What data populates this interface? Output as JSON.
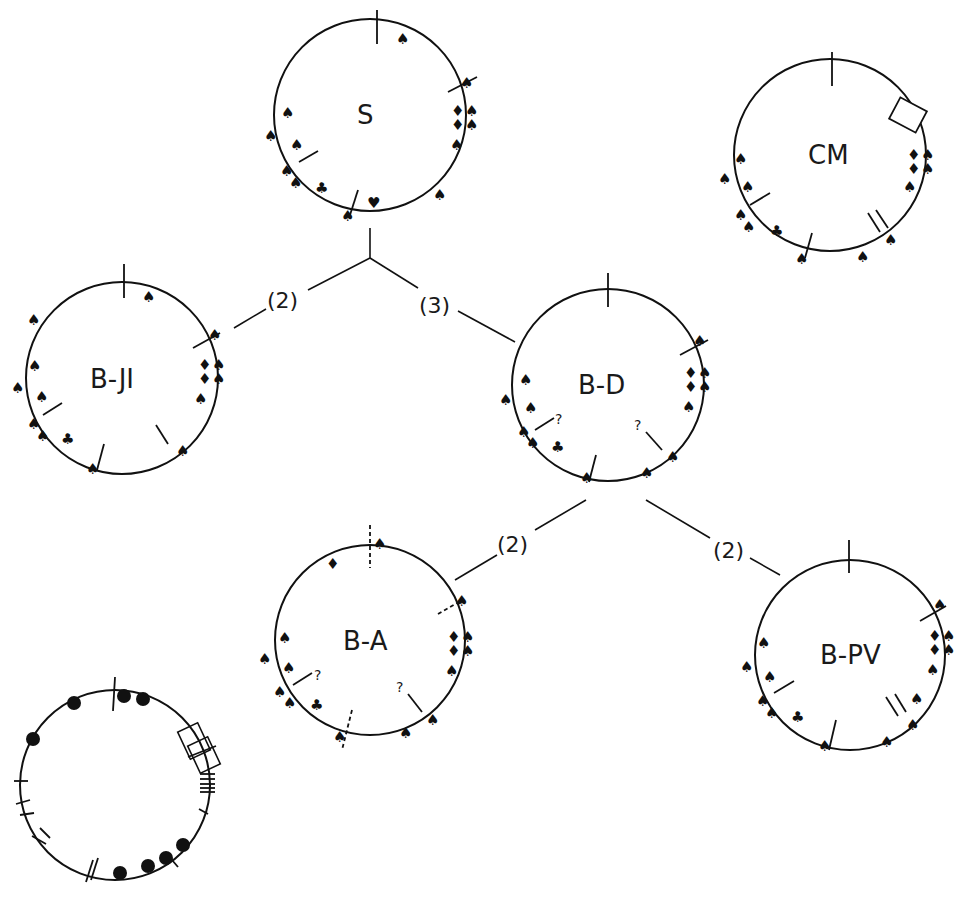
{
  "diagram": {
    "type": "circular genome maps / phylogenetic tree",
    "colors": {
      "ink": "#111111",
      "background": "#ffffff"
    },
    "nodes": [
      {
        "id": "S",
        "label": "S",
        "cx": 370,
        "cy": 115,
        "r": 96
      },
      {
        "id": "CM",
        "label": "CM",
        "cx": 830,
        "cy": 155,
        "r": 96
      },
      {
        "id": "B-JI",
        "label": "B-JI",
        "cx": 122,
        "cy": 378,
        "r": 96
      },
      {
        "id": "B-D",
        "label": "B-D",
        "cx": 608,
        "cy": 385,
        "r": 96
      },
      {
        "id": "B-A",
        "label": "B-A",
        "cx": 370,
        "cy": 640,
        "r": 95
      },
      {
        "id": "B-PV",
        "label": "B-PV",
        "cx": 850,
        "cy": 655,
        "r": 95
      }
    ],
    "branches": [
      {
        "from": "S",
        "to": "B-JI",
        "label": "(2)"
      },
      {
        "from": "S",
        "to": "B-D",
        "label": "(3)"
      },
      {
        "from": "B-D",
        "to": "B-A",
        "label": "(2)"
      },
      {
        "from": "B-D",
        "to": "B-PV",
        "label": "(2)"
      }
    ],
    "annotations": {
      "question_mark": "?",
      "marker_types": [
        "spade-marker",
        "club-marker",
        "diamond-marker",
        "heart-marker",
        "arrow-marker",
        "tick-marker",
        "dashed-tick-marker",
        "box-marker"
      ]
    },
    "key_circle": {
      "label": "",
      "features": [
        "filled-dots",
        "ticks",
        "double-ticks",
        "triple-ticks",
        "boxes"
      ]
    }
  }
}
